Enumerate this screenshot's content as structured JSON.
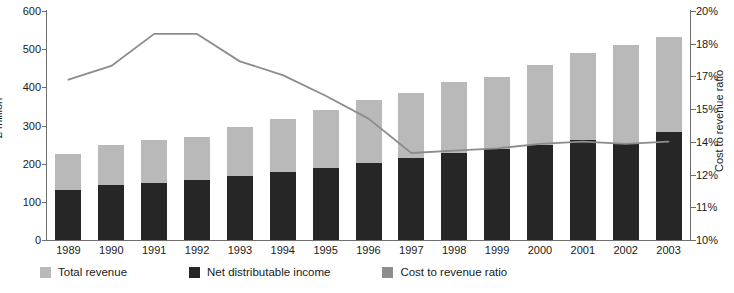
{
  "chart_data": {
    "type": "bar",
    "title": "",
    "subtitle": "",
    "xlabel": "",
    "ylabel": "£ million",
    "y2label": "Cost to revenue ratio",
    "grid": false,
    "legend_position": "bottom-left",
    "categories": [
      "1989",
      "1990",
      "1991",
      "1992",
      "1993",
      "1994",
      "1995",
      "1996",
      "1997",
      "1998",
      "1999",
      "2000",
      "2001",
      "2002",
      "2003"
    ],
    "ylim": [
      0,
      600
    ],
    "yticks": [
      0,
      100,
      200,
      300,
      400,
      500,
      600
    ],
    "ytick_labels": [
      "0",
      "100",
      "200",
      "300",
      "400",
      "500",
      "600"
    ],
    "y2lim": [
      10,
      20
    ],
    "y2ticks": [
      10,
      11.43,
      12.86,
      14.29,
      15.71,
      17.14,
      18.57,
      20
    ],
    "y2tick_labels": [
      "10%",
      "11%",
      "12%",
      "14%",
      "15%",
      "17%",
      "18%",
      "20%"
    ],
    "series": [
      {
        "name": "Total revenue",
        "type": "bar",
        "color": "#b9b9b9",
        "axis": "left",
        "units": "£ million",
        "values": [
          225,
          249,
          261,
          271,
          297,
          317,
          340,
          366,
          385,
          414,
          428,
          458,
          490,
          512,
          531
        ]
      },
      {
        "name": "Net distributable income",
        "type": "bar",
        "color": "#262626",
        "axis": "left",
        "units": "£ million",
        "values": [
          131,
          143,
          150,
          158,
          168,
          178,
          189,
          203,
          214,
          228,
          238,
          249,
          263,
          254,
          283
        ]
      },
      {
        "name": "Cost to revenue ratio",
        "type": "line",
        "color": "#8c8c8c",
        "axis": "right",
        "units": "%",
        "values": [
          17.0,
          17.6,
          19.0,
          19.0,
          17.8,
          17.2,
          16.3,
          15.3,
          13.8,
          13.9,
          14.0,
          14.2,
          14.3,
          14.2,
          14.3
        ]
      }
    ]
  },
  "legend": {
    "items": [
      {
        "label": "Total revenue",
        "color": "#b9b9b9"
      },
      {
        "label": "Net distributable income",
        "color": "#262626"
      },
      {
        "label": "Cost to revenue ratio",
        "color": "#8c8c8c"
      }
    ]
  }
}
